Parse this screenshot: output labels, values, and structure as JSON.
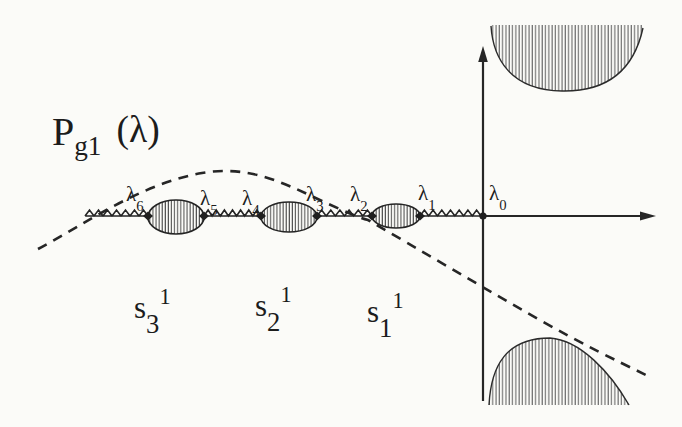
{
  "background": "#fbfbf8",
  "ink": "#1f1f1f",
  "polynomial_label": {
    "base": "P",
    "sub": "g1",
    "arg": "(λ)"
  },
  "lambda_labels": [
    {
      "base": "λ",
      "sub": "6"
    },
    {
      "base": "λ",
      "sub": "5"
    },
    {
      "base": "λ",
      "sub": "4"
    },
    {
      "base": "λ",
      "sub": "3"
    },
    {
      "base": "λ",
      "sub": "2"
    },
    {
      "base": "λ",
      "sub": "1"
    },
    {
      "base": "λ",
      "sub": "0"
    }
  ],
  "gap_labels": [
    {
      "base": "s",
      "sub": "3",
      "sup": "1"
    },
    {
      "base": "s",
      "sub": "2",
      "sup": "1"
    },
    {
      "base": "s",
      "sub": "1",
      "sup": "1"
    }
  ]
}
